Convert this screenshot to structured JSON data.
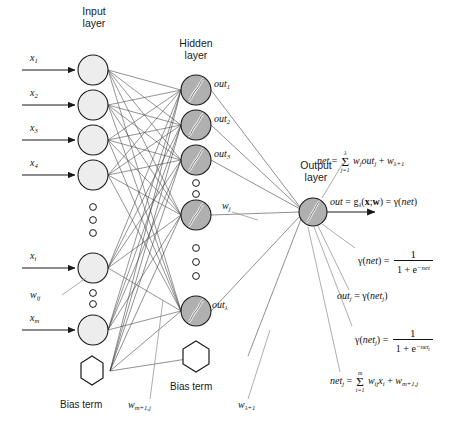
{
  "diagram": {
    "layers": {
      "input_label_line1": "Input",
      "input_label_line2": "layer",
      "hidden_label_line1": "Hidden",
      "hidden_label_line2": "layer",
      "output_label_line1": "Output",
      "output_label_line2": "layer"
    },
    "input_nodes": [
      {
        "id": "x1",
        "label_base": "x",
        "label_sub": "1"
      },
      {
        "id": "x2",
        "label_base": "x",
        "label_sub": "2"
      },
      {
        "id": "x3",
        "label_base": "x",
        "label_sub": "3"
      },
      {
        "id": "x4",
        "label_base": "x",
        "label_sub": "4"
      },
      {
        "id": "xi",
        "label_base": "x",
        "label_sub": "i"
      },
      {
        "id": "xm",
        "label_base": "x",
        "label_sub": "m"
      }
    ],
    "hidden_nodes": [
      {
        "id": "h1",
        "label_base": "out",
        "label_sub": "1"
      },
      {
        "id": "h2",
        "label_base": "out",
        "label_sub": "2"
      },
      {
        "id": "h3",
        "label_base": "out",
        "label_sub": "3"
      },
      {
        "id": "hj",
        "label_base": "",
        "label_sub": ""
      },
      {
        "id": "hlambda",
        "label_base": "out",
        "label_sub": "λ"
      }
    ],
    "weight_labels": {
      "input_to_hidden_base": "w",
      "input_to_hidden_sub": "ij",
      "hidden_to_output_base": "w",
      "hidden_to_output_sub": "j",
      "bias_input_base": "w",
      "bias_input_sub": "m+1,j",
      "bias_hidden_base": "w",
      "bias_hidden_sub": "λ+1"
    },
    "bias_terms": {
      "input_bias_label": "Bias term",
      "hidden_bias_label": "Bias term"
    },
    "equations": {
      "net_out": "net = Σ(j=1..λ) w_j out_j + w_λ+1",
      "out": "out = g_λ(x;w) = γ(net)",
      "gamma_net": "γ(net) = 1 / (1 + e^-net)",
      "out_j": "out_j = γ(net_j)",
      "gamma_net_j": "γ(net_j) = 1 / (1 + e^-net_j)",
      "net_j": "net_j = Σ(i=1..m) w_ij x_i + w_m+1,j"
    },
    "colors": {
      "input_node_fill": "#ededed",
      "hidden_node_fill": "#b0b0b0",
      "output_node_fill": "#b0b0b0",
      "bias_node_fill": "#ffffff",
      "stroke": "#1a1a1a",
      "text": "#1a1a1a"
    }
  }
}
